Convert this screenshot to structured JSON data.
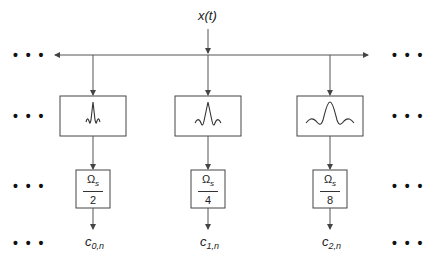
{
  "diagram": {
    "input_label": "x(t)",
    "ellipsis": "• • •",
    "channels": [
      {
        "id": 0,
        "filter_icon": "narrow-wavelet-icon",
        "decimation": {
          "numerator": "Ω",
          "numerator_sub": "s",
          "denominator": "2"
        },
        "output": {
          "base": "c",
          "sub": "0,n"
        }
      },
      {
        "id": 1,
        "filter_icon": "medium-wavelet-icon",
        "decimation": {
          "numerator": "Ω",
          "numerator_sub": "s",
          "denominator": "4"
        },
        "output": {
          "base": "c",
          "sub": "1,n"
        }
      },
      {
        "id": 2,
        "filter_icon": "wide-wavelet-icon",
        "decimation": {
          "numerator": "Ω",
          "numerator_sub": "s",
          "denominator": "8"
        },
        "output": {
          "base": "c",
          "sub": "2,n"
        }
      }
    ],
    "colors": {
      "line": "#555555",
      "text": "#222222",
      "background": "#ffffff"
    }
  }
}
